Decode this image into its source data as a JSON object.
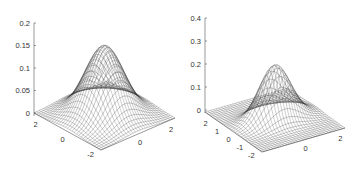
{
  "chart_data": [
    {
      "type": "surface",
      "title": "",
      "xlabel": "",
      "ylabel": "",
      "zlabel": "",
      "z_ticks": [
        "0",
        "0.05",
        "0.1",
        "0.15",
        "0.2"
      ],
      "z_range": [
        0,
        0.2
      ],
      "x_ticks": [
        "-2",
        "0",
        "2"
      ],
      "y_ticks": [
        "2",
        "0"
      ],
      "x_range": [
        -2.5,
        2.5
      ],
      "y_range": [
        -2.5,
        2.5
      ],
      "function": "isotropic 2D Gaussian",
      "peak_value": 0.155,
      "peak_location": [
        0,
        0
      ],
      "sigma": [
        1.0,
        1.0
      ],
      "grid": false,
      "style": "mesh lines, black on white"
    },
    {
      "type": "surface",
      "title": "",
      "xlabel": "",
      "ylabel": "",
      "zlabel": "",
      "z_ticks": [
        "0",
        "0.1",
        "0.2",
        "0.3",
        "0.4"
      ],
      "z_range": [
        0,
        0.4
      ],
      "x_ticks": [
        "-2",
        "0",
        "2"
      ],
      "y_ticks": [
        "2",
        "1",
        "0",
        "-1",
        "-2"
      ],
      "x_range": [
        -2.5,
        2.5
      ],
      "y_range": [
        -2.5,
        2.5
      ],
      "function": "anisotropic (narrow) 2D Gaussian",
      "peak_value": 0.24,
      "peak_location": [
        0,
        0
      ],
      "sigma": [
        0.9,
        0.55
      ],
      "grid": false,
      "style": "mesh lines, black on white"
    }
  ]
}
